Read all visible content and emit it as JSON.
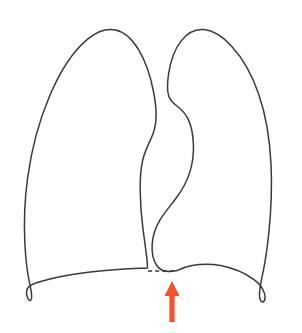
{
  "figure": {
    "name": "lungs-anatomical-outline",
    "background_color": "#ffffff",
    "width": 302,
    "height": 333
  },
  "style": {
    "outline_color": "#3a3a3a",
    "outline_width": 1.5,
    "accent_color": "#f4512c",
    "dash_color": "#3a3a3a"
  },
  "parts": {
    "left_lung": {
      "label": "left-lung-outline",
      "description": "Left lung (viewer's left) outline",
      "apex": [
        118,
        31
      ],
      "lateral_extent": [
        25,
        215
      ],
      "base_corner": [
        28,
        300
      ]
    },
    "right_lung": {
      "label": "right-lung-outline",
      "description": "Right lung (viewer's right) outline with cardiac notch",
      "apex": [
        200,
        31
      ],
      "lateral_extent": [
        277,
        215
      ],
      "base_corner": [
        262,
        301
      ],
      "cardiac_notch": [
        172,
        90
      ]
    },
    "midline": {
      "label": "midline-dashed-segment",
      "description": "Dashed segment bridging the two lung bases at the midline",
      "start": [
        148,
        271
      ],
      "end": [
        177,
        271
      ],
      "dash_pattern": "4 3.2"
    },
    "pointer": {
      "label": "arrow-indicator",
      "description": "Orange-red upward arrow pointing at the midline dashed segment",
      "color": "#f4512c",
      "tip": [
        172,
        281
      ],
      "tail": [
        172,
        322
      ],
      "shaft_width": 5.2,
      "head_width": 15,
      "head_height": 15,
      "direction": "up"
    }
  },
  "annotations": {
    "caption": ""
  }
}
